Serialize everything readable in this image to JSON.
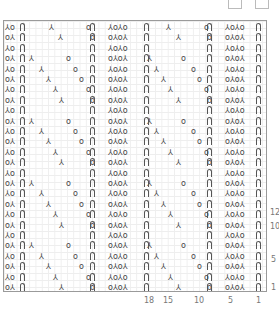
{
  "chart_data": {
    "type": "table",
    "title": "",
    "row_labels": [
      "1",
      "5",
      "10",
      "12"
    ],
    "column_labels": [
      "18",
      "15",
      "10",
      "5",
      "1"
    ],
    "symbols": {
      "twisted_stitch": "Π",
      "decrease": "⅄",
      "decrease_alt": "⅄",
      "yarn_over": "o"
    },
    "rows": [
      {
        "left": "⅄o",
        "a_dec": 48,
        "a_yo": 85,
        "mid": "⅄o⅄o",
        "b_dec": 165,
        "b_yo": 203
      },
      {
        "left": "o⅄",
        "a_dec": 57,
        "a_yo": 89,
        "mid": "o⅄o⅄",
        "b_dec": 175,
        "b_yo": 206
      },
      {
        "left": "⅄o",
        "a_dec": null,
        "a_yo": null,
        "mid": "⅄o⅄o",
        "b_dec": null,
        "b_yo": null
      },
      {
        "left": "o⅄",
        "a_dec": 28,
        "a_yo": 65,
        "mid": "o⅄o⅄",
        "b_dec": 146,
        "b_yo": 180
      },
      {
        "left": "⅄o",
        "a_dec": 38,
        "a_yo": 72,
        "mid": "⅄o⅄o",
        "b_dec": 153,
        "b_yo": 190
      },
      {
        "left": "o⅄",
        "a_dec": 45,
        "a_yo": 78,
        "mid": "o⅄o⅄",
        "b_dec": 160,
        "b_yo": 196
      },
      {
        "left": "⅄o",
        "a_dec": 52,
        "a_yo": 85,
        "mid": "⅄o⅄o",
        "b_dec": 167,
        "b_yo": 203
      },
      {
        "left": "o⅄",
        "a_dec": 58,
        "a_yo": 89,
        "mid": "o⅄o⅄",
        "b_dec": 175,
        "b_yo": 206
      },
      {
        "left": "⅄o",
        "a_dec": null,
        "a_yo": null,
        "mid": "⅄o⅄o",
        "b_dec": null,
        "b_yo": null
      },
      {
        "left": "o⅄",
        "a_dec": 28,
        "a_yo": 65,
        "mid": "o⅄o⅄",
        "b_dec": 146,
        "b_yo": 180
      },
      {
        "left": "⅄o",
        "a_dec": 38,
        "a_yo": 72,
        "mid": "⅄o⅄o",
        "b_dec": 153,
        "b_yo": 190
      },
      {
        "left": "o⅄",
        "a_dec": 45,
        "a_yo": 78,
        "mid": "o⅄o⅄",
        "b_dec": 160,
        "b_yo": 196
      },
      {
        "left": "⅄o",
        "a_dec": 52,
        "a_yo": 85,
        "mid": "⅄o⅄o",
        "b_dec": 167,
        "b_yo": 203
      },
      {
        "left": "o⅄",
        "a_dec": 58,
        "a_yo": 89,
        "mid": "o⅄o⅄",
        "b_dec": 175,
        "b_yo": 206
      },
      {
        "left": "⅄o",
        "a_dec": null,
        "a_yo": null,
        "mid": "⅄o⅄o",
        "b_dec": null,
        "b_yo": null
      },
      {
        "left": "o⅄",
        "a_dec": 28,
        "a_yo": 65,
        "mid": "o⅄o⅄",
        "b_dec": 146,
        "b_yo": 180
      },
      {
        "left": "⅄o",
        "a_dec": 38,
        "a_yo": 72,
        "mid": "⅄o⅄o",
        "b_dec": 153,
        "b_yo": 190
      },
      {
        "left": "o⅄",
        "a_dec": 45,
        "a_yo": 78,
        "mid": "o⅄o⅄",
        "b_dec": 160,
        "b_yo": 196
      },
      {
        "left": "⅄o",
        "a_dec": 52,
        "a_yo": 85,
        "mid": "⅄o⅄o",
        "b_dec": 167,
        "b_yo": 203
      },
      {
        "left": "o⅄",
        "a_dec": 58,
        "a_yo": 89,
        "mid": "o⅄o⅄",
        "b_dec": 175,
        "b_yo": 206
      },
      {
        "left": "⅄o",
        "a_dec": null,
        "a_yo": null,
        "mid": "⅄o⅄o",
        "b_dec": null,
        "b_yo": null
      },
      {
        "left": "o⅄",
        "a_dec": 28,
        "a_yo": 65,
        "mid": "o⅄o⅄",
        "b_dec": 146,
        "b_yo": 180
      },
      {
        "left": "⅄o",
        "a_dec": 38,
        "a_yo": 72,
        "mid": "⅄o⅄o",
        "b_dec": 153,
        "b_yo": 190
      },
      {
        "left": "o⅄",
        "a_dec": 45,
        "a_yo": 78,
        "mid": "o⅄o⅄",
        "b_dec": 160,
        "b_yo": 196
      },
      {
        "left": "⅄o",
        "a_dec": 52,
        "a_yo": 85,
        "mid": "⅄o⅄o",
        "b_dec": 167,
        "b_yo": 203
      },
      {
        "left": "o⅄",
        "a_dec": 58,
        "a_yo": 89,
        "mid": "o⅄o⅄",
        "b_dec": 175,
        "b_yo": 206
      }
    ]
  },
  "labels": {
    "row_12": "12",
    "row_10": "10",
    "row_5": "5",
    "row_1": "1",
    "col_18": "18",
    "col_15": "15",
    "col_10": "10",
    "col_5": "5",
    "col_1": "1"
  }
}
